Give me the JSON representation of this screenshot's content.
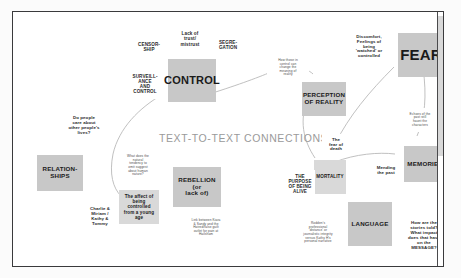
{
  "board": {
    "title": "TEXT-TO-TEXT CONNECTIONS",
    "accent_tile": "#c8c8c8",
    "accent_subtile": "#d9d9d9",
    "frame_color": "#3a3a3c",
    "canvas_color": "#ffffff"
  },
  "nodes": [
    {
      "id": "censorship",
      "label": "CENSOR-\nSHIP",
      "kind": "note-lbl",
      "x": 119,
      "y": 25,
      "w": 34,
      "h": 20
    },
    {
      "id": "lack-of-trust",
      "label": "Lack of\ntrust/\nmistrust",
      "kind": "note-lbl",
      "x": 161,
      "y": 16,
      "w": 32,
      "h": 22
    },
    {
      "id": "segregation",
      "label": "SEGRE-\nGATION",
      "kind": "note-lbl",
      "x": 198,
      "y": 24,
      "w": 34,
      "h": 18
    },
    {
      "id": "surveillance",
      "label": "SURVEILL-\nANCE\nAND\nCONTROL",
      "kind": "note-lbl",
      "x": 112,
      "y": 57,
      "w": 40,
      "h": 30
    },
    {
      "id": "control",
      "label": "CONTROL",
      "kind": "tile-big",
      "x": 155,
      "y": 47,
      "w": 48,
      "h": 43
    },
    {
      "id": "how-those-control",
      "label": "How those in\ncontrol can\nchange the\nmeaning of\nreality",
      "kind": "bubble",
      "x": 254,
      "y": 43,
      "w": 42,
      "h": 26
    },
    {
      "id": "perception",
      "label": "PERCEPTION\nOF REALITY",
      "kind": "tile-med",
      "x": 289,
      "y": 70,
      "w": 44,
      "h": 34
    },
    {
      "id": "discomfort",
      "label": "Discomfort,\nFeelings of\nbeing\n'watched' or\ncontrolled",
      "kind": "note",
      "x": 334,
      "y": 20,
      "w": 44,
      "h": 30
    },
    {
      "id": "fear",
      "label": "FEAR",
      "kind": "tile-huge",
      "x": 385,
      "y": 21,
      "w": 46,
      "h": 44
    },
    {
      "id": "echoes",
      "label": "Echoes of the\npast still\nhaunt the\ncharacters",
      "kind": "bubble",
      "x": 386,
      "y": 96,
      "w": 42,
      "h": 24
    },
    {
      "id": "do-people-care",
      "label": "Do people\ncare about\nother people's\nlives?",
      "kind": "note",
      "x": 49,
      "y": 101,
      "w": 44,
      "h": 26
    },
    {
      "id": "relationships",
      "label": "RELATION-\nSHIPS",
      "kind": "tile-med",
      "x": 24,
      "y": 143,
      "w": 46,
      "h": 36
    },
    {
      "id": "charlie-miriam",
      "label": "Charlie &\nMiriam /\nKathy &\nTommy",
      "kind": "note",
      "x": 68,
      "y": 192,
      "w": 38,
      "h": 26
    },
    {
      "id": "what-does-natural",
      "label": "What does the\nnatural\ntendency to\nomit suggest\nabout human\nnature?",
      "kind": "bubble",
      "x": 104,
      "y": 139,
      "w": 42,
      "h": 30
    },
    {
      "id": "affect-controlled",
      "label": "The affect of\nbeing\ncontrolled\nfrom a young\nage",
      "kind": "subtile",
      "x": 106,
      "y": 178,
      "w": 40,
      "h": 34
    },
    {
      "id": "rebellion",
      "label": "REBELLION (or\nlack of)",
      "kind": "tile-med",
      "x": 160,
      "y": 155,
      "w": 48,
      "h": 40
    },
    {
      "id": "link-between",
      "label": "Link between Kiara\n& Sandy and the\nHatred/false guilt\noutlet for pain at\nHailsham",
      "kind": "bubble",
      "x": 171,
      "y": 203,
      "w": 44,
      "h": 26
    },
    {
      "id": "fear-of-death",
      "label": "The\nfear of\ndeath",
      "kind": "note",
      "x": 309,
      "y": 122,
      "w": 28,
      "h": 22
    },
    {
      "id": "mortality",
      "label": "MORTALITY",
      "kind": "subtile",
      "x": 301,
      "y": 148,
      "w": 32,
      "h": 34
    },
    {
      "id": "purpose-alive",
      "label": "THE\nPURPOSE\nOF BEING\nALIVE",
      "kind": "note-lbl",
      "x": 272,
      "y": 158,
      "w": 30,
      "h": 28
    },
    {
      "id": "mending-past",
      "label": "Mending\nthe past",
      "kind": "note",
      "x": 357,
      "y": 150,
      "w": 32,
      "h": 18
    },
    {
      "id": "memories",
      "label": "MEMORIES",
      "kind": "tile-med",
      "x": 391,
      "y": 134,
      "w": 42,
      "h": 36
    },
    {
      "id": "roddens-distance",
      "label": "Rodden's\nprofessional\n'distance' or\njournalistic integrity\nversus Kathy H's\npersonal narrative",
      "kind": "bubble",
      "x": 283,
      "y": 206,
      "w": 44,
      "h": 30
    },
    {
      "id": "language",
      "label": "LANGUAGE",
      "kind": "tile-med",
      "x": 335,
      "y": 190,
      "w": 44,
      "h": 44
    },
    {
      "id": "how-are-stories",
      "label": "How are the\nstories told?\nWhat impact\ndoes that have\non the\nMESSAGE?",
      "kind": "note",
      "x": 388,
      "y": 206,
      "w": 46,
      "h": 36
    }
  ],
  "connectors": [
    {
      "id": "control-to-perception",
      "d": "M 190 84 C 222 74 244 66 258 60"
    },
    {
      "id": "perception-curve",
      "d": "M 276 58 C 290 56 296 58 300 62"
    },
    {
      "id": "control-down-left",
      "d": "M 150 82 C 126 96 106 116 100 142"
    },
    {
      "id": "affect-arc",
      "d": "M 100 142 C 96 162 100 176 108 184"
    },
    {
      "id": "perception-to-mortality",
      "d": "M 295 86 C 286 108 290 128 302 146"
    },
    {
      "id": "fear-left-curve",
      "d": "M 381 55 C 356 80 336 104 322 132"
    },
    {
      "id": "fear-right-curve",
      "d": "M 410 56 C 414 84 412 106 404 124"
    },
    {
      "id": "mortality-to-memories",
      "d": "M 322 150 C 342 142 366 140 382 142"
    }
  ]
}
